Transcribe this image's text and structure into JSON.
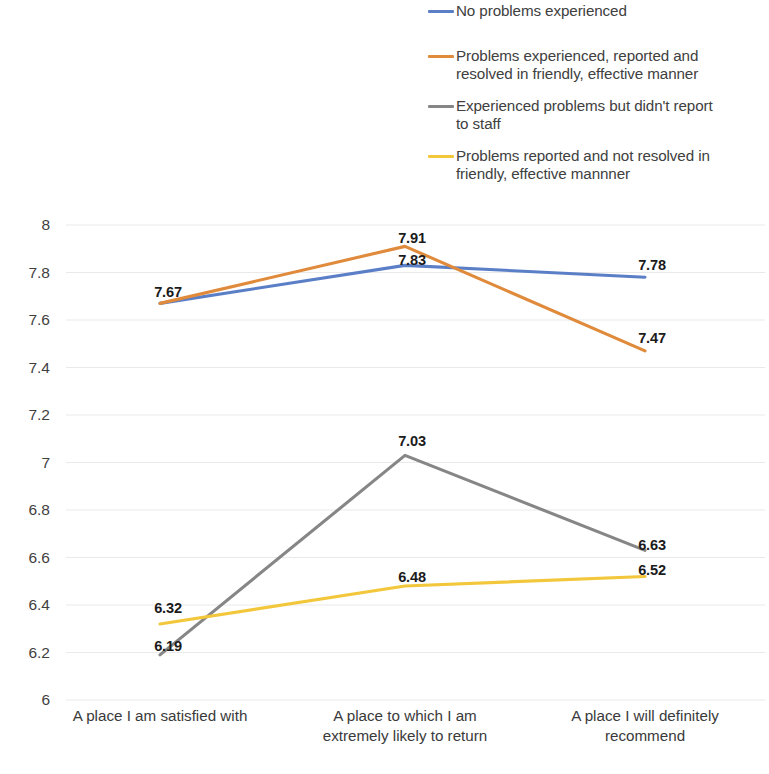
{
  "chart_data": {
    "type": "line",
    "title": "",
    "xlabel": "",
    "ylabel": "",
    "ylim": [
      6,
      8
    ],
    "ytick_step": 0.2,
    "grid": true,
    "legend_position": "top-right",
    "categories": [
      "A place I am satisfied with",
      "A place to which I am extremely likely to return",
      "A place I will definitely recommend"
    ],
    "category_lines": [
      [
        "A place I am satisfied with"
      ],
      [
        "A place to which I am",
        "extremely likely to return"
      ],
      [
        "A place I will definitely",
        "recommend"
      ]
    ],
    "yticks": [
      "8",
      "7.8",
      "7.6",
      "7.4",
      "7.2",
      "7",
      "6.8",
      "6.6",
      "6.4",
      "6.2",
      "6"
    ],
    "ytick_values": [
      8,
      7.8,
      7.6,
      7.4,
      7.2,
      7,
      6.8,
      6.6,
      6.4,
      6.2,
      6
    ],
    "series": [
      {
        "name": "No problems experienced",
        "color": "#5b7fc7",
        "values": [
          7.67,
          7.83,
          7.78
        ],
        "labels": [
          "7.67",
          "7.83",
          "7.78"
        ]
      },
      {
        "name": "Problems experienced, reported and resolved in friendly, effective manner",
        "color": "#e08a3c",
        "values": [
          7.67,
          7.91,
          7.47
        ],
        "labels": [
          "7.67",
          "7.91",
          "7.47"
        ]
      },
      {
        "name": "Experienced problems but didn't report to staff",
        "color": "#868686",
        "values": [
          6.19,
          7.03,
          6.63
        ],
        "labels": [
          "6.19",
          "7.03",
          "6.63"
        ]
      },
      {
        "name": "Problems reported and not resolved in friendly, effective mannner",
        "color": "#f3c73c",
        "values": [
          6.32,
          6.48,
          6.52
        ],
        "labels": [
          "6.32",
          "6.48",
          "6.52"
        ]
      }
    ]
  },
  "legend": {
    "items": [
      {
        "color": "#5b7fc7",
        "lines": [
          "No problems experienced"
        ]
      },
      {
        "color": "#e08a3c",
        "lines": [
          "Problems experienced, reported and",
          "resolved in friendly, effective manner"
        ]
      },
      {
        "color": "#868686",
        "lines": [
          "Experienced problems but didn't report",
          "to staff"
        ]
      },
      {
        "color": "#f3c73c",
        "lines": [
          "Problems reported and not resolved in",
          "friendly, effective mannner"
        ]
      }
    ]
  },
  "value_labels": [
    {
      "text": "7.67",
      "x": 168,
      "y": 292
    },
    {
      "text": "7.91",
      "x": 412,
      "y": 238
    },
    {
      "text": "7.83",
      "x": 412,
      "y": 260
    },
    {
      "text": "7.78",
      "x": 652,
      "y": 265
    },
    {
      "text": "7.47",
      "x": 652,
      "y": 338
    },
    {
      "text": "7.03",
      "x": 412,
      "y": 441
    },
    {
      "text": "6.48",
      "x": 412,
      "y": 577
    },
    {
      "text": "6.32",
      "x": 168,
      "y": 608
    },
    {
      "text": "6.19",
      "x": 168,
      "y": 646
    },
    {
      "text": "6.63",
      "x": 652,
      "y": 545
    },
    {
      "text": "6.52",
      "x": 652,
      "y": 570
    }
  ]
}
